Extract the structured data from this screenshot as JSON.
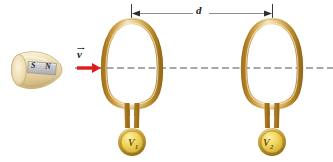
{
  "figure": {
    "background_color": "#ffffff"
  },
  "magnet": {
    "name": "bar-magnet",
    "body_color": "#e7d5a8",
    "body_highlight": "#f6ecd2",
    "plate_color": "#c9c9cb",
    "south_pole_label": "S",
    "north_pole_label": "N"
  },
  "velocity": {
    "label": "v",
    "has_vector_arrow": true,
    "arrow_color": "#e01b1b",
    "direction": "right"
  },
  "distance": {
    "label": "d",
    "arrow_color": "#8a8a8a",
    "tick_color": "#3a3a3a"
  },
  "axis": {
    "name": "dashed-center-axis",
    "style": "dashed",
    "color": "#55555a"
  },
  "loops": [
    {
      "name": "loop-1",
      "voltmeter_label": "V",
      "voltmeter_subscript": "1",
      "tube_color_dark": "#b98c35",
      "tube_color_light": "#f0d99a",
      "meter_face_color": "#f2d560"
    },
    {
      "name": "loop-2",
      "voltmeter_label": "V",
      "voltmeter_subscript": "2",
      "tube_color_dark": "#b98c35",
      "tube_color_light": "#f0d99a",
      "meter_face_color": "#f2d560"
    }
  ],
  "colors": {
    "brass_dark": "#b08227",
    "brass_mid": "#d7ae52",
    "brass_light": "#f4e2ad",
    "meter_gold": "#e8c93f",
    "red": "#e01b1b",
    "gray": "#8a8a8a"
  }
}
